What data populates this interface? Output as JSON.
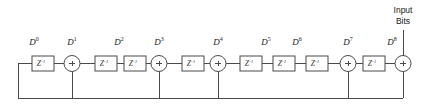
{
  "figure": {
    "input_label_line1": "Input",
    "input_label_line2": "Bits",
    "delay_symbol": "Z",
    "delay_exponent": "-1",
    "adder_symbol": "+",
    "line_color": "#4a4a4a",
    "background_color": "#ffffff"
  },
  "taps": [
    {
      "base": "D",
      "exponent": "0",
      "x": 34,
      "y": 45
    },
    {
      "base": "D",
      "exponent": "1",
      "x": 72,
      "y": 45
    },
    {
      "base": "D",
      "exponent": "2",
      "x": 119,
      "y": 45
    },
    {
      "base": "D",
      "exponent": "3",
      "x": 159,
      "y": 45
    },
    {
      "base": "D",
      "exponent": "4",
      "x": 218,
      "y": 45
    },
    {
      "base": "D",
      "exponent": "5",
      "x": 266,
      "y": 45
    },
    {
      "base": "D",
      "exponent": "6",
      "x": 297,
      "y": 45
    },
    {
      "base": "D",
      "exponent": "7",
      "x": 348,
      "y": 45
    },
    {
      "base": "D",
      "exponent": "8",
      "x": 392,
      "y": 45
    }
  ],
  "delays": [
    {
      "id": "delay-0",
      "x": 32,
      "y": 56,
      "w": 22,
      "h": 15
    },
    {
      "id": "delay-1",
      "x": 95,
      "y": 56,
      "w": 22,
      "h": 15
    },
    {
      "id": "delay-2",
      "x": 124,
      "y": 56,
      "w": 22,
      "h": 15
    },
    {
      "id": "delay-3",
      "x": 182,
      "y": 56,
      "w": 22,
      "h": 15
    },
    {
      "id": "delay-4",
      "x": 240,
      "y": 56,
      "w": 22,
      "h": 15
    },
    {
      "id": "delay-5",
      "x": 273,
      "y": 56,
      "w": 22,
      "h": 15
    },
    {
      "id": "delay-6",
      "x": 306,
      "y": 56,
      "w": 22,
      "h": 15
    },
    {
      "id": "delay-7",
      "x": 363,
      "y": 56,
      "w": 22,
      "h": 15
    }
  ],
  "adders": [
    {
      "id": "adder-0",
      "cx": 72,
      "cy": 63.5,
      "r": 8
    },
    {
      "id": "adder-1",
      "cx": 159,
      "cy": 63.5,
      "r": 8
    },
    {
      "id": "adder-2",
      "cx": 218,
      "cy": 63.5,
      "r": 8
    },
    {
      "id": "adder-3",
      "cx": 348,
      "cy": 63.5,
      "r": 8
    },
    {
      "id": "adder-4",
      "cx": 403,
      "cy": 63.5,
      "r": 8
    }
  ],
  "feedback_bus": {
    "y": 98,
    "x_left": 18,
    "x_right": 403,
    "left_riser_top": 63.5
  },
  "input_line": {
    "x": 403,
    "y_top": 30,
    "y_bottom": 55.5
  }
}
